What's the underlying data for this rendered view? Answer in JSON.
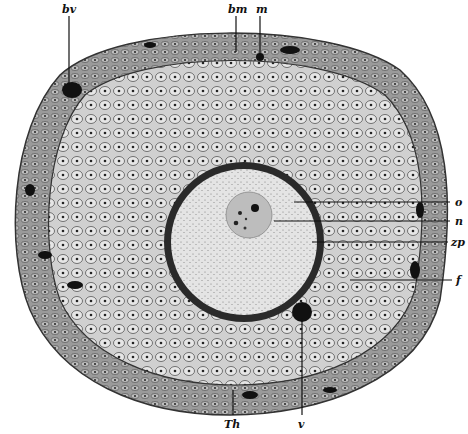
{
  "figure": {
    "labels": [
      {
        "id": "bv",
        "text": "bv",
        "x": 62,
        "y": 4
      },
      {
        "id": "bm",
        "text": "bm",
        "x": 228,
        "y": 4
      },
      {
        "id": "m",
        "text": "m",
        "x": 256,
        "y": 4
      },
      {
        "id": "o",
        "text": "o",
        "x": 455,
        "y": 198
      },
      {
        "id": "n",
        "text": "n",
        "x": 455,
        "y": 217
      },
      {
        "id": "zp",
        "text": "zp",
        "x": 452,
        "y": 238
      },
      {
        "id": "f",
        "text": "f",
        "x": 456,
        "y": 277
      },
      {
        "id": "Th",
        "text": "Th",
        "x": 225,
        "y": 420
      },
      {
        "id": "v",
        "text": "v",
        "x": 297,
        "y": 420
      }
    ],
    "colors": {
      "theca": "#8a8a8a",
      "granulosa": "#c8c8c8",
      "cytoplasm": "#e4e4e4",
      "zona": "#2a2a2a",
      "nucleus": "#bdbdbd",
      "ink": "#111111"
    }
  }
}
